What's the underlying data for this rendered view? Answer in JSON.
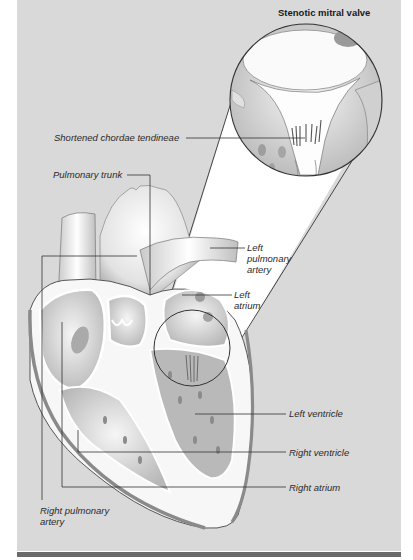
{
  "diagram": {
    "inset_title": "Stenotic mitral valve",
    "colors": {
      "background": "#d9d9d9",
      "bottom_bar": "#6a6a6a",
      "line": "#333333",
      "tissue_light": "#f4f4f4",
      "tissue_mid": "#bdbdbd",
      "tissue_dark": "#8a8a8a"
    },
    "labels": {
      "chordae": "Shortened chordae tendineae",
      "pulmonary_trunk": "Pulmonary trunk",
      "left_pulmonary_artery_1": "Left",
      "left_pulmonary_artery_2": "pulmonary",
      "left_pulmonary_artery_3": "artery",
      "left_atrium_1": "Left",
      "left_atrium_2": "atrium",
      "left_ventricle": "Left ventricle",
      "right_ventricle": "Right ventricle",
      "right_atrium": "Right atrium",
      "right_pulmonary_artery_1": "Right pulmonary",
      "right_pulmonary_artery_2": "artery"
    }
  }
}
